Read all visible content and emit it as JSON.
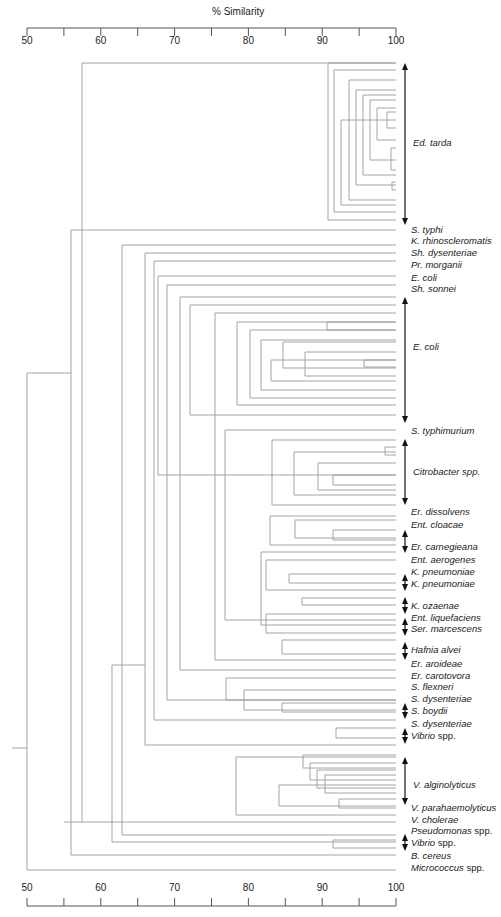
{
  "axis": {
    "title": "% Similarity",
    "ticks": [
      50,
      55,
      60,
      65,
      70,
      75,
      80,
      85,
      90,
      95,
      100
    ],
    "labeled_ticks": [
      "50",
      "60",
      "70",
      "80",
      "90",
      "100"
    ],
    "min": 50,
    "max": 100
  },
  "labels": [
    {
      "text": "S. typhi",
      "y": 230
    },
    {
      "text": "K. rhinoscleromatis",
      "y": 241
    },
    {
      "text": "Sh. dysenteriae",
      "y": 253
    },
    {
      "text": "Pr. morganii",
      "y": 265
    },
    {
      "text": "E. coli",
      "y": 278
    },
    {
      "text": "Sh. sonnei",
      "y": 289
    },
    {
      "text": "S. typhimurium",
      "y": 431
    },
    {
      "text": "Er. dissolvens",
      "y": 512
    },
    {
      "text": "Ent. cloacae",
      "y": 525
    },
    {
      "text": "Er. carnegieana",
      "y": 547
    },
    {
      "text": "Ent. aerogenes",
      "y": 560
    },
    {
      "text": "K. pneumoniae",
      "y": 572
    },
    {
      "text": "K. pneumoniae",
      "y": 584
    },
    {
      "text": "K. ozaenae",
      "y": 606
    },
    {
      "text": "Ent. liquefaciens",
      "y": 618
    },
    {
      "text": "Ser. marcescens",
      "y": 629
    },
    {
      "text": "Hafnia alvei",
      "y": 650
    },
    {
      "text": "Er. aroideae",
      "y": 664
    },
    {
      "text": "Er. carotovora",
      "y": 676
    },
    {
      "text": "S. flexneri",
      "y": 687
    },
    {
      "text": "S. dysenteriae",
      "y": 699
    },
    {
      "text": "S. boydii",
      "y": 711
    },
    {
      "text": "S. dysenteriae",
      "y": 724
    },
    {
      "text": "Vibrio",
      "suffix": " spp.",
      "y": 736
    },
    {
      "text": "V. parahaemolyticus",
      "y": 808
    },
    {
      "text": "V. cholerae",
      "y": 820
    },
    {
      "text": "Pseudomonas",
      "suffix": " spp.",
      "y": 831
    },
    {
      "text": "Vibrio",
      "suffix": " spp.",
      "y": 843
    },
    {
      "text": "B. cereus",
      "y": 856
    },
    {
      "text": "Micrococcus",
      "suffix": " spp.",
      "y": 868
    }
  ],
  "groups": [
    {
      "text": "Ed. tarda",
      "y": 143,
      "arrow_top": 63,
      "arrow_bottom": 225
    },
    {
      "text": "E. coli",
      "y": 347,
      "arrow_top": 297,
      "arrow_bottom": 423
    },
    {
      "text": "Citrobacter",
      "suffix": " spp.",
      "y": 472,
      "arrow_top": 439,
      "arrow_bottom": 505
    },
    {
      "text": "V. alginolyticus",
      "y": 785,
      "arrow_top": 757,
      "arrow_bottom": 805
    }
  ],
  "small_arrows": [
    {
      "top": 530,
      "bottom": 553
    },
    {
      "top": 574,
      "bottom": 591
    },
    {
      "top": 597,
      "bottom": 614
    },
    {
      "top": 618,
      "bottom": 636
    },
    {
      "top": 642,
      "bottom": 660
    },
    {
      "top": 703,
      "bottom": 719
    },
    {
      "top": 728,
      "bottom": 744
    },
    {
      "top": 834,
      "bottom": 851
    }
  ],
  "dendrogram": {
    "leaf_x": 396,
    "line_color": "#9a9a9a",
    "segments": [
      [
        12,
        748,
        27,
        748
      ],
      [
        27,
        373,
        27,
        870
      ],
      [
        27,
        373,
        71,
        373
      ],
      [
        27,
        870,
        396,
        870
      ],
      [
        71,
        230,
        71,
        855
      ],
      [
        71,
        230,
        396,
        230
      ],
      [
        71,
        855,
        396,
        855
      ],
      [
        82,
        63,
        82,
        822
      ],
      [
        82,
        63,
        396,
        63
      ],
      [
        82,
        822,
        396,
        822
      ],
      [
        64,
        822,
        82,
        822
      ],
      [
        122,
        245,
        122,
        835
      ],
      [
        122,
        245,
        396,
        245
      ],
      [
        122,
        835,
        396,
        835
      ],
      [
        112,
        665,
        112,
        842
      ],
      [
        112,
        665,
        145,
        665
      ],
      [
        112,
        842,
        396,
        842
      ],
      [
        145,
        253,
        145,
        745
      ],
      [
        145,
        253,
        396,
        253
      ],
      [
        145,
        745,
        396,
        745
      ],
      [
        154,
        261,
        154,
        720
      ],
      [
        154,
        261,
        396,
        261
      ],
      [
        154,
        720,
        396,
        720
      ],
      [
        158,
        276,
        158,
        475
      ],
      [
        158,
        276,
        396,
        276
      ],
      [
        158,
        475,
        396,
        475
      ],
      [
        167,
        285,
        167,
        700
      ],
      [
        167,
        285,
        396,
        285
      ],
      [
        167,
        700,
        396,
        700
      ],
      [
        180,
        297,
        180,
        670
      ],
      [
        180,
        297,
        396,
        297
      ],
      [
        180,
        670,
        396,
        670
      ],
      [
        190,
        305,
        190,
        415
      ],
      [
        190,
        305,
        396,
        305
      ],
      [
        190,
        415,
        396,
        415
      ],
      [
        215,
        313,
        215,
        660
      ],
      [
        215,
        313,
        396,
        313
      ],
      [
        215,
        660,
        396,
        660
      ],
      [
        225,
        430,
        225,
        620
      ],
      [
        225,
        430,
        396,
        430
      ],
      [
        225,
        620,
        396,
        620
      ],
      [
        237,
        322,
        237,
        405
      ],
      [
        237,
        322,
        396,
        322
      ],
      [
        237,
        405,
        396,
        405
      ],
      [
        250,
        330,
        250,
        398
      ],
      [
        250,
        330,
        396,
        330
      ],
      [
        250,
        398,
        396,
        398
      ],
      [
        261,
        340,
        261,
        390
      ],
      [
        261,
        340,
        396,
        340
      ],
      [
        261,
        390,
        396,
        390
      ],
      [
        283,
        342,
        283,
        368
      ],
      [
        283,
        342,
        396,
        342
      ],
      [
        283,
        368,
        396,
        368
      ],
      [
        327,
        322,
        327,
        330
      ],
      [
        327,
        322,
        396,
        322
      ],
      [
        327,
        330,
        396,
        330
      ],
      [
        271,
        360,
        271,
        381
      ],
      [
        271,
        360,
        396,
        360
      ],
      [
        271,
        381,
        396,
        381
      ],
      [
        305,
        352,
        305,
        376
      ],
      [
        305,
        352,
        396,
        352
      ],
      [
        305,
        376,
        396,
        376
      ],
      [
        364,
        360,
        364,
        367
      ],
      [
        364,
        360,
        396,
        360
      ],
      [
        364,
        367,
        396,
        367
      ],
      [
        272,
        440,
        272,
        505
      ],
      [
        272,
        440,
        396,
        440
      ],
      [
        272,
        505,
        396,
        505
      ],
      [
        294,
        452,
        294,
        495
      ],
      [
        294,
        452,
        396,
        452
      ],
      [
        294,
        495,
        396,
        495
      ],
      [
        318,
        463,
        318,
        490
      ],
      [
        318,
        463,
        396,
        463
      ],
      [
        318,
        490,
        396,
        490
      ],
      [
        333,
        475,
        333,
        485
      ],
      [
        333,
        475,
        396,
        475
      ],
      [
        333,
        485,
        396,
        485
      ],
      [
        385,
        447,
        385,
        455
      ],
      [
        385,
        447,
        396,
        447
      ],
      [
        385,
        455,
        396,
        455
      ],
      [
        270,
        516,
        270,
        545
      ],
      [
        270,
        516,
        396,
        516
      ],
      [
        270,
        545,
        396,
        545
      ],
      [
        295,
        520,
        295,
        538
      ],
      [
        295,
        520,
        396,
        520
      ],
      [
        295,
        538,
        396,
        538
      ],
      [
        333,
        530,
        333,
        540
      ],
      [
        333,
        530,
        396,
        530
      ],
      [
        333,
        540,
        396,
        540
      ],
      [
        261,
        552,
        261,
        625
      ],
      [
        261,
        552,
        396,
        552
      ],
      [
        261,
        625,
        396,
        625
      ],
      [
        266,
        560,
        266,
        590
      ],
      [
        266,
        560,
        396,
        560
      ],
      [
        266,
        590,
        396,
        590
      ],
      [
        289,
        574,
        289,
        583
      ],
      [
        289,
        574,
        396,
        574
      ],
      [
        289,
        583,
        396,
        583
      ],
      [
        302,
        598,
        302,
        605
      ],
      [
        302,
        598,
        396,
        598
      ],
      [
        302,
        605,
        396,
        605
      ],
      [
        266,
        614,
        266,
        633
      ],
      [
        266,
        614,
        396,
        614
      ],
      [
        266,
        633,
        396,
        633
      ],
      [
        282,
        640,
        282,
        654
      ],
      [
        282,
        640,
        396,
        640
      ],
      [
        282,
        654,
        396,
        654
      ],
      [
        226,
        678,
        226,
        700
      ],
      [
        226,
        678,
        396,
        678
      ],
      [
        226,
        700,
        396,
        700
      ],
      [
        244,
        690,
        244,
        710
      ],
      [
        244,
        690,
        396,
        690
      ],
      [
        244,
        710,
        396,
        710
      ],
      [
        282,
        703,
        282,
        712
      ],
      [
        282,
        703,
        396,
        703
      ],
      [
        282,
        712,
        396,
        712
      ],
      [
        336,
        728,
        336,
        738
      ],
      [
        336,
        728,
        396,
        728
      ],
      [
        336,
        738,
        396,
        738
      ],
      [
        236,
        757,
        236,
        815
      ],
      [
        236,
        757,
        396,
        757
      ],
      [
        236,
        815,
        396,
        815
      ],
      [
        279,
        785,
        279,
        806
      ],
      [
        279,
        785,
        396,
        785
      ],
      [
        279,
        806,
        396,
        806
      ],
      [
        303,
        755,
        303,
        768
      ],
      [
        303,
        755,
        396,
        755
      ],
      [
        303,
        768,
        396,
        768
      ],
      [
        310,
        763,
        310,
        780
      ],
      [
        310,
        763,
        396,
        763
      ],
      [
        310,
        780,
        396,
        780
      ],
      [
        317,
        770,
        317,
        788
      ],
      [
        317,
        770,
        396,
        770
      ],
      [
        317,
        788,
        396,
        788
      ],
      [
        325,
        775,
        325,
        793
      ],
      [
        325,
        775,
        396,
        775
      ],
      [
        325,
        793,
        396,
        793
      ],
      [
        339,
        799,
        339,
        808
      ],
      [
        339,
        799,
        396,
        799
      ],
      [
        339,
        808,
        396,
        808
      ],
      [
        333,
        840,
        333,
        848
      ],
      [
        333,
        840,
        396,
        840
      ],
      [
        333,
        848,
        396,
        848
      ],
      [
        328,
        63,
        328,
        220
      ],
      [
        328,
        63,
        396,
        63
      ],
      [
        328,
        220,
        396,
        220
      ],
      [
        334,
        70,
        334,
        212
      ],
      [
        334,
        70,
        396,
        70
      ],
      [
        334,
        212,
        396,
        212
      ],
      [
        341,
        120,
        341,
        205
      ],
      [
        341,
        120,
        396,
        120
      ],
      [
        341,
        205,
        396,
        205
      ],
      [
        349,
        80,
        349,
        200
      ],
      [
        349,
        80,
        396,
        80
      ],
      [
        349,
        200,
        396,
        200
      ],
      [
        356,
        90,
        356,
        185
      ],
      [
        356,
        90,
        396,
        90
      ],
      [
        356,
        185,
        396,
        185
      ],
      [
        363,
        95,
        363,
        175
      ],
      [
        363,
        95,
        396,
        95
      ],
      [
        363,
        175,
        396,
        175
      ],
      [
        370,
        100,
        370,
        160
      ],
      [
        370,
        100,
        396,
        100
      ],
      [
        370,
        160,
        396,
        160
      ],
      [
        377,
        108,
        377,
        140
      ],
      [
        377,
        108,
        396,
        108
      ],
      [
        377,
        140,
        396,
        140
      ],
      [
        387,
        112,
        387,
        128
      ],
      [
        387,
        112,
        396,
        112
      ],
      [
        387,
        128,
        396,
        128
      ],
      [
        391,
        148,
        391,
        170
      ],
      [
        391,
        148,
        396,
        148
      ],
      [
        391,
        170,
        396,
        170
      ],
      [
        392,
        182,
        392,
        190
      ],
      [
        392,
        182,
        396,
        182
      ],
      [
        392,
        190,
        396,
        190
      ]
    ]
  }
}
